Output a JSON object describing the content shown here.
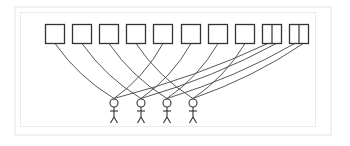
{
  "diagram": {
    "frame": {
      "outer_color": "#f0f0f0",
      "inner_color": "#ebebeb"
    },
    "stroke_color": "#333333",
    "boxes": [
      {
        "id": "b1",
        "x": 45,
        "split": false
      },
      {
        "id": "b2",
        "x": 72,
        "split": false
      },
      {
        "id": "b3",
        "x": 99,
        "split": false
      },
      {
        "id": "b4",
        "x": 126,
        "split": false
      },
      {
        "id": "b5",
        "x": 153,
        "split": false
      },
      {
        "id": "b6",
        "x": 181,
        "split": false
      },
      {
        "id": "b7",
        "x": 208,
        "split": false
      },
      {
        "id": "b8",
        "x": 235,
        "split": false
      },
      {
        "id": "b9",
        "x": 262,
        "split": true
      },
      {
        "id": "b10",
        "x": 289,
        "split": true
      }
    ],
    "box_size": 19,
    "box_top": 24,
    "people": [
      {
        "id": "p1",
        "x": 114
      },
      {
        "id": "p2",
        "x": 141
      },
      {
        "id": "p3",
        "x": 167
      },
      {
        "id": "p4",
        "x": 193
      }
    ],
    "connections": [
      {
        "from": "b1",
        "to": "p1"
      },
      {
        "from": "b2",
        "to": "p2"
      },
      {
        "from": "b3",
        "to": "p3"
      },
      {
        "from": "b4",
        "to": "p4"
      },
      {
        "from": "b5",
        "to": "p1"
      },
      {
        "from": "b6",
        "to": "p2"
      },
      {
        "from": "b7",
        "to": "p3"
      },
      {
        "from": "b8",
        "to": "p4"
      },
      {
        "from": "b9a",
        "to": "p1"
      },
      {
        "from": "b9b",
        "to": "p2"
      },
      {
        "from": "b10a",
        "to": "p3"
      },
      {
        "from": "b10b",
        "to": "p4"
      }
    ]
  }
}
